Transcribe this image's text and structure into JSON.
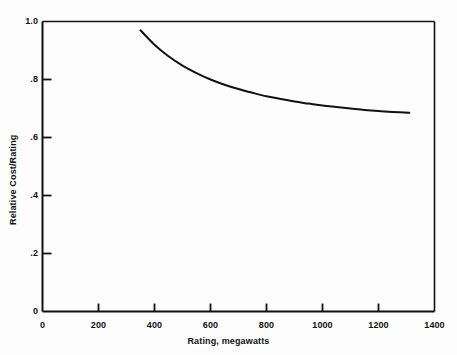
{
  "chart_data": {
    "type": "line",
    "title": "",
    "subtitle": "",
    "xlabel": "Rating, megawatts",
    "ylabel": "Relative Cost/Rating",
    "xlim": [
      0,
      1400
    ],
    "ylim": [
      0,
      1.0
    ],
    "grid": false,
    "legend": "none",
    "xticks": [
      0,
      200,
      400,
      600,
      800,
      1000,
      1200,
      1400
    ],
    "xtick_labels": [
      "0",
      "200",
      "400",
      "600",
      "800",
      "1000",
      "1200",
      "1400"
    ],
    "yticks": [
      0,
      0.2,
      0.4,
      0.6,
      0.8,
      1.0
    ],
    "ytick_labels": [
      "0",
      ".2",
      ".4",
      ".6",
      ".8",
      "1.0"
    ],
    "series": [
      {
        "name": "Relative Cost/Rating",
        "x": [
          350,
          400,
          450,
          500,
          550,
          600,
          650,
          700,
          750,
          800,
          850,
          900,
          950,
          1000,
          1050,
          1100,
          1150,
          1200,
          1250,
          1310
        ],
        "values": [
          0.97,
          0.92,
          0.88,
          0.848,
          0.822,
          0.8,
          0.782,
          0.767,
          0.754,
          0.742,
          0.733,
          0.724,
          0.717,
          0.71,
          0.705,
          0.7,
          0.695,
          0.691,
          0.688,
          0.685
        ]
      }
    ],
    "line_color": "#111111",
    "axis_color": "#111111",
    "background_color": "#fdfdfd",
    "annotations": []
  }
}
